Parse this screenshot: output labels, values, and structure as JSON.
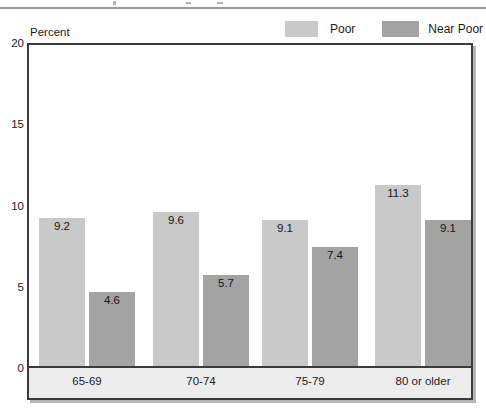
{
  "colors": {
    "poor": "#c9c9c9",
    "near_poor": "#a3a3a3",
    "frame_border": "#3a3a3a",
    "band_fill": "#ececec",
    "shadow": "#b6b6b6",
    "top_rule": "#9c9c9c",
    "text": "#1c1c1c"
  },
  "legend": {
    "items": [
      {
        "label": "Poor",
        "swatch_color": "#c9c9c9"
      },
      {
        "label": "Near Poor",
        "swatch_color": "#a3a3a3"
      }
    ]
  },
  "chart_data": {
    "type": "bar",
    "title": "",
    "ylabel": "Percent",
    "xlabel": "",
    "ylim": [
      0,
      20
    ],
    "yticks": [
      0,
      5,
      10,
      15,
      20
    ],
    "grid": false,
    "legend_position": "top-right",
    "value_labels": true,
    "categories": [
      "65-69",
      "70-74",
      "75-79",
      "80 or older"
    ],
    "series": [
      {
        "name": "Poor",
        "color": "#c9c9c9",
        "values": [
          9.2,
          9.6,
          9.1,
          11.3
        ]
      },
      {
        "name": "Near Poor",
        "color": "#a3a3a3",
        "values": [
          4.6,
          5.7,
          7.4,
          9.1
        ]
      }
    ]
  }
}
